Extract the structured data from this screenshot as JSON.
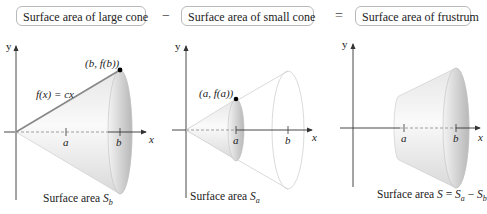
{
  "header": {
    "boxes": [
      {
        "label": "Surface area of large cone"
      },
      {
        "label": "Surface area of small cone"
      },
      {
        "label": "Surface area of frustrum"
      }
    ],
    "operators": {
      "minus": "−",
      "equals": "="
    }
  },
  "panels": [
    {
      "name": "large-cone",
      "axis_labels": {
        "x": "x",
        "y": "y"
      },
      "ticks": [
        "a",
        "b"
      ],
      "point_label": "(b, f(b))",
      "function_label": "f(x) = cx",
      "caption": {
        "prefix": "Surface area ",
        "symbol": "S",
        "subscript": "b"
      }
    },
    {
      "name": "small-cone",
      "axis_labels": {
        "x": "x",
        "y": "y"
      },
      "ticks": [
        "a",
        "b"
      ],
      "point_label": "(a, f(a))",
      "caption": {
        "prefix": "Surface area ",
        "symbol": "S",
        "subscript": "a"
      }
    },
    {
      "name": "frustrum",
      "axis_labels": {
        "x": "x",
        "y": "y"
      },
      "ticks": [
        "a",
        "b"
      ],
      "caption": {
        "prefix": "Surface area ",
        "symbol": "S",
        "eq": " = ",
        "s1": "S",
        "sub1": "a",
        "minus": " − ",
        "s2": "S",
        "sub2": "b"
      }
    }
  ],
  "colors": {
    "cone_light": "#f2f2f2",
    "cone_mid": "#d6d6d6",
    "cone_dark": "#a9a9a9",
    "axis": "#333333",
    "outline": "#d0d0d0"
  }
}
